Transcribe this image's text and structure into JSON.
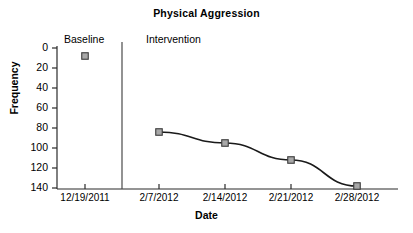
{
  "chart": {
    "title": "Physical Aggression",
    "xlabel": "Date",
    "ylabel": "Frequency",
    "phase_labels": {
      "baseline": "Baseline",
      "intervention": "Intervention"
    }
  },
  "chart_data": {
    "type": "line",
    "title": "Physical Aggression",
    "xlabel": "Date",
    "ylabel": "Frequency",
    "ylim": [
      0,
      140
    ],
    "yticks": [
      0,
      20,
      40,
      60,
      80,
      100,
      120,
      140
    ],
    "ytick_labels": [
      "0",
      "20",
      "40",
      "60",
      "80",
      "100",
      "120",
      "140"
    ],
    "categories": [
      "12/19/2011",
      "2/7/2012",
      "2/14/2012",
      "2/21/2012",
      "2/28/2012"
    ],
    "grid": false,
    "legend": "none",
    "annotations": [
      "Baseline",
      "Intervention"
    ],
    "phase_change_after": "12/19/2011",
    "series": [
      {
        "name": "Baseline",
        "connected": false,
        "points": [
          {
            "x": "12/19/2011",
            "y": 132
          }
        ]
      },
      {
        "name": "Intervention",
        "connected": true,
        "points": [
          {
            "x": "2/7/2012",
            "y": 56
          },
          {
            "x": "2/14/2012",
            "y": 45
          },
          {
            "x": "2/21/2012",
            "y": 28
          },
          {
            "x": "2/28/2012",
            "y": 2
          }
        ]
      }
    ],
    "marker": {
      "shape": "square",
      "fill": "#a8a8a8",
      "edge": "#3a3a3a"
    },
    "line_color": "#1a1a1a"
  },
  "ytick_positions": [
    48,
    68,
    88,
    108,
    128,
    148,
    168,
    188
  ],
  "xtick_positions": [
    85,
    159,
    225,
    291,
    357
  ]
}
